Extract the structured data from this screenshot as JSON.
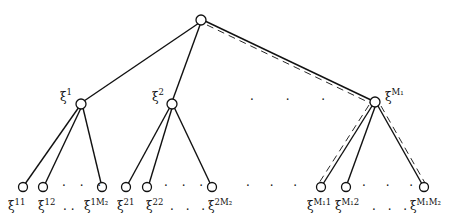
{
  "diagram": {
    "type": "tree",
    "root": {
      "id": "root",
      "label": ""
    },
    "level1": [
      {
        "id": "n1",
        "base": "ξ",
        "sup": "1"
      },
      {
        "id": "n2",
        "base": "ξ",
        "sup": "2"
      },
      {
        "id": "nM1",
        "base": "ξ",
        "sup": "M₁"
      }
    ],
    "level1_ellipsis": "· · ·",
    "level2": [
      {
        "parent": "n1",
        "base": "ξ",
        "sup": "11"
      },
      {
        "parent": "n1",
        "base": "ξ",
        "sup": "12"
      },
      {
        "parent": "n1",
        "base": "ξ",
        "sup": "1M₂"
      },
      {
        "parent": "n2",
        "base": "ξ",
        "sup": "21"
      },
      {
        "parent": "n2",
        "base": "ξ",
        "sup": "22"
      },
      {
        "parent": "n2",
        "base": "ξ",
        "sup": "2M₂"
      },
      {
        "parent": "nM1",
        "base": "ξ",
        "sup": "M₁1"
      },
      {
        "parent": "nM1",
        "base": "ξ",
        "sup": "M₁2"
      },
      {
        "parent": "nM1",
        "base": "ξ",
        "sup": "M₁M₂"
      }
    ],
    "ellipses": {
      "group1_top": "· · ·",
      "group1_bottom": "··",
      "group2_top": "· · ·",
      "group2_bottom": "· · ·",
      "between_groups": "· · ·",
      "groupM_top": "· · ·",
      "groupM_bottom": "· · ·"
    },
    "highlighted_edges": [
      [
        "root",
        "nM1"
      ],
      [
        "nM1",
        "ξ^{M₁1}"
      ],
      [
        "nM1",
        "ξ^{M₁M₂}"
      ]
    ]
  }
}
